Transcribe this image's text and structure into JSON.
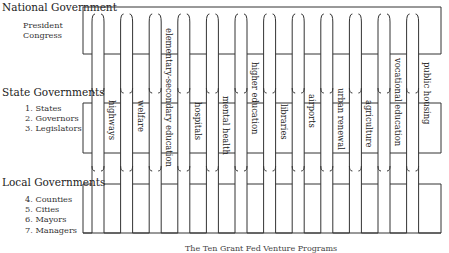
{
  "levels": {
    "national": {
      "title": "National Government",
      "members": [
        "President",
        "Congress"
      ]
    },
    "state": {
      "title": "State Governments",
      "members": [
        "1. States",
        "2. Governors",
        "3. Legislators"
      ]
    },
    "local": {
      "title": "Local Governments",
      "members": [
        "4. Counties",
        "5. Cities",
        "6. Mayors",
        "7. Managers"
      ]
    }
  },
  "pickets": [
    "highways",
    "welfare",
    "elementary-secondary education",
    "hospitals",
    "mental health",
    "higher education",
    "libraries",
    "airports",
    "urban renewal",
    "agriculture",
    "vocational education",
    "public housing"
  ],
  "caption": "The Ten Grant Fed Venture Programs"
}
